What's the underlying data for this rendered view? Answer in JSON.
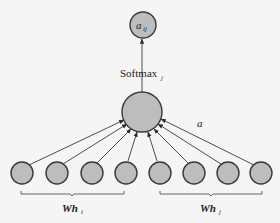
{
  "diagram": {
    "output_node": {
      "label": "a",
      "subscript": "ij"
    },
    "edge_label_softmax": {
      "label": "Softmax",
      "subscript": "j"
    },
    "attention_label": "a",
    "input_group_left": {
      "label": "Wh",
      "subscript": "i",
      "node_count": 4
    },
    "input_group_right": {
      "label": "Wh",
      "subscript": "j",
      "node_count": 4
    },
    "colors": {
      "node_fill": "#bdbdbd",
      "node_stroke": "#3a3a3a",
      "background": "#f5f5f5"
    }
  }
}
